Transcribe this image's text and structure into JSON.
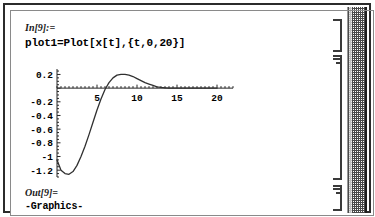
{
  "window": {
    "app": "Mathematica Notebook",
    "scrollbar_name": "vertical-scrollbar"
  },
  "cells": {
    "input": {
      "label": "In[9]:=",
      "code": "plot1=Plot[x[t],{t,0,20}]"
    },
    "output_graphics": {
      "label": "Out[9]=",
      "text": "-Graphics-"
    }
  },
  "chart_data": {
    "type": "line",
    "title": "",
    "xlabel": "",
    "ylabel": "",
    "xlim": [
      0,
      22
    ],
    "ylim": [
      -1.3,
      0.28
    ],
    "grid": false,
    "legend": null,
    "xticks": [
      5,
      10,
      15,
      20
    ],
    "xtick_labels": [
      "5",
      "10",
      "15",
      "20"
    ],
    "yticks": [
      0.2,
      -0.2,
      -0.4,
      -0.6,
      -0.8,
      -1,
      -1.2
    ],
    "ytick_labels": [
      "0.2",
      "-0.2",
      "-0.4",
      "-0.6",
      "-0.8",
      "-1",
      "-1.2"
    ],
    "axis_origin_y": 0,
    "series": [
      {
        "name": "x[t]",
        "color": "#303030",
        "x": [
          0,
          0.5,
          1,
          1.5,
          2,
          2.5,
          3,
          3.5,
          4,
          4.5,
          5,
          5.5,
          6,
          6.5,
          7,
          7.5,
          8,
          8.5,
          9,
          9.5,
          10,
          10.5,
          11,
          11.5,
          12,
          12.5,
          13,
          13.5,
          14,
          15,
          16,
          17,
          18,
          19,
          20
        ],
        "y": [
          -1.05,
          -1.2,
          -1.25,
          -1.26,
          -1.22,
          -1.13,
          -1.0,
          -0.85,
          -0.68,
          -0.5,
          -0.32,
          -0.16,
          -0.02,
          0.08,
          0.15,
          0.19,
          0.2,
          0.2,
          0.19,
          0.17,
          0.14,
          0.11,
          0.08,
          0.06,
          0.04,
          0.02,
          0.01,
          0.005,
          0.0,
          0.0,
          0.0,
          0.0,
          0.0,
          0.0,
          0.0
        ]
      }
    ]
  }
}
